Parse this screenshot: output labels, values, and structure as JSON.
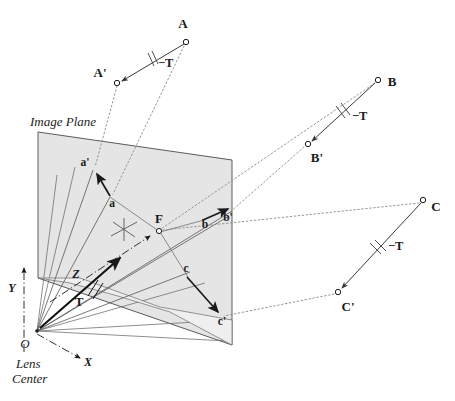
{
  "figure": {
    "title": "Image Plane",
    "plane_label": "Image Plane",
    "lens_center_o": "O",
    "lens_center_line1": "Lens",
    "lens_center_line2": "Center",
    "axis_x": "X",
    "axis_y": "Y",
    "axis_z": "Z",
    "translation_vector": "T",
    "colors": {
      "ink": "#1a1a1a",
      "plane_fill": "#e3e3e3",
      "plane_stroke": "#4a4a4a",
      "dashed": "#777777",
      "ray": "#555555",
      "background": "#ffffff"
    }
  },
  "world_points": [
    {
      "id": "A",
      "label": "A",
      "kind": "world-point",
      "x": 186,
      "y": 42
    },
    {
      "id": "Ap",
      "label": "A'",
      "kind": "translated-point",
      "x": 117,
      "y": 83
    },
    {
      "id": "B",
      "label": "B",
      "kind": "world-point",
      "x": 378,
      "y": 80
    },
    {
      "id": "Bp",
      "label": "B'",
      "kind": "translated-point",
      "x": 308,
      "y": 144
    },
    {
      "id": "C",
      "label": "C",
      "kind": "world-point",
      "x": 423,
      "y": 200
    },
    {
      "id": "Cp",
      "label": "C'",
      "kind": "translated-point",
      "x": 338,
      "y": 292
    }
  ],
  "image_points": [
    {
      "id": "ap",
      "label": "a'",
      "kind": "projected-translated",
      "x": 93,
      "y": 170
    },
    {
      "id": "a",
      "label": "a",
      "kind": "projected",
      "x": 110,
      "y": 197
    },
    {
      "id": "b",
      "label": "b",
      "kind": "projected",
      "x": 204,
      "y": 217
    },
    {
      "id": "bp",
      "label": "b'",
      "kind": "projected-translated",
      "x": 227,
      "y": 213
    },
    {
      "id": "c",
      "label": "c",
      "kind": "projected",
      "x": 186,
      "y": 275
    },
    {
      "id": "cp",
      "label": "c'",
      "kind": "projected-translated",
      "x": 221,
      "y": 316
    },
    {
      "id": "F",
      "label": "F",
      "kind": "focus-of-expansion",
      "x": 157,
      "y": 227
    }
  ],
  "translation_marks": [
    {
      "id": "T-A",
      "label": "−T",
      "x": 152,
      "y": 63
    },
    {
      "id": "T-B",
      "label": "−T",
      "x": 347,
      "y": 116
    },
    {
      "id": "T-C",
      "label": "−T",
      "x": 385,
      "y": 249
    }
  ],
  "origin": {
    "x": 37,
    "y": 331
  }
}
